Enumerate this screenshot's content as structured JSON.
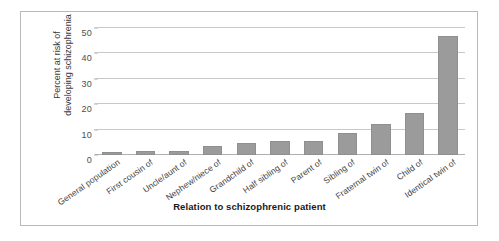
{
  "chart_data": {
    "type": "bar",
    "title": "",
    "xlabel": "Relation to schizophrenic patient",
    "ylabel": "Percent at risk of developing schizophrenia",
    "ylabel_line1": "Percent at risk of",
    "ylabel_line2": "developing schizophrenia",
    "categories": [
      "General population",
      "First cousin of",
      "Uncle/aunt of",
      "Nephew/niece of",
      "Grandchild of",
      "Half sibling of",
      "Parent of",
      "Sibling of",
      "Fraternal twin of",
      "Child of",
      "Identical twin of"
    ],
    "values": [
      1,
      1.5,
      1.7,
      3.7,
      4.8,
      5.4,
      5.7,
      8.7,
      12.4,
      16.6,
      47
    ],
    "ylim": [
      0,
      50
    ],
    "yticks": [
      0,
      10,
      20,
      30,
      40,
      50
    ],
    "ytick_labels": [
      "0",
      "10",
      "20",
      "30",
      "40",
      "50"
    ],
    "grid": true,
    "legend": false,
    "bar_color": "#9b9b9b",
    "gridline_color": "#c8c8c8",
    "frame_color": "#b9b9b9",
    "background_color": "#ffffff"
  }
}
